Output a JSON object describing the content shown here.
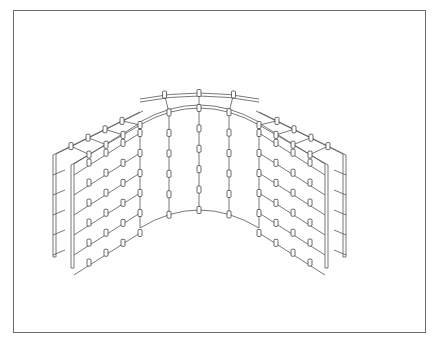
{
  "figure": {
    "frame": {
      "x": 13,
      "y": 10,
      "w": 411,
      "h": 321,
      "color": "#6a6a6a"
    },
    "stroke_color": "#555555",
    "rows": 6,
    "row_spacing": 20,
    "left_wall": {
      "back_panel": {
        "x_outer": 53,
        "top_outer": 155,
        "x_inner": 140,
        "top_inner": 112,
        "height": 102
      },
      "front_panel": {
        "x_outer": 71,
        "top_outer": 165,
        "x_inner": 140,
        "top_inner": 125,
        "height": 103
      },
      "tie_columns_x": [
        89,
        106,
        123,
        140
      ]
    },
    "right_wall": {
      "back_panel": {
        "x_outer": 346,
        "top_outer": 155,
        "x_inner": 259,
        "top_inner": 112,
        "height": 102
      },
      "front_panel": {
        "x_outer": 328,
        "top_outer": 165,
        "x_inner": 259,
        "top_inner": 125,
        "height": 103
      },
      "tie_columns_x": [
        259,
        276,
        293,
        310
      ]
    },
    "curve": {
      "x_left": 140,
      "x_right": 259,
      "x_center": 199,
      "outer_top_y_center": 93,
      "inner_top_y_center": 108,
      "bottom_y_center": 210,
      "edge_top_outer_y": 112,
      "edge_top_inner_y": 125,
      "edge_bottom_y": 228,
      "column_x": [
        169,
        199,
        229
      ],
      "clip_rows_y": [
        0,
        20,
        40,
        60,
        80
      ]
    }
  }
}
